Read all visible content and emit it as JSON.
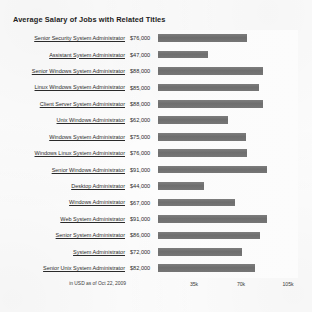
{
  "chart_data": {
    "type": "bar",
    "orientation": "horizontal",
    "title": "Average Salary of Jobs with Related Titles",
    "xlabel": "",
    "ylabel": "",
    "note": "in USD as of Oct 22, 2009",
    "xlim": [
      0,
      110000
    ],
    "grid": false,
    "legend": "none",
    "xticks": [
      {
        "label": "35k",
        "value": 35000
      },
      {
        "label": "70k",
        "value": 70000
      },
      {
        "label": "105k",
        "value": 105000
      }
    ],
    "categories": [
      "Senior Security System Administrator",
      "Assistant System Administrator",
      "Senior Windows System Administrator",
      "Linux Windows System Administrator",
      "Client Server System Administrator",
      "Unix Windows Administrator",
      "Windows System Administrator",
      "Windows Linux System Administrator",
      "Senior Windows Administrator",
      "Desktop Administrator",
      "Windows Administrator",
      "Web System Administrator",
      "Senior System Administrator",
      "System Administrator",
      "Senior Unix System Administrator"
    ],
    "values": [
      76000,
      47000,
      88000,
      85000,
      88000,
      62000,
      75000,
      76000,
      91000,
      44000,
      67000,
      91000,
      86000,
      72000,
      82000
    ],
    "value_labels": [
      "$76,000",
      "$47,000",
      "$88,000",
      "$85,000",
      "$88,000",
      "$62,000",
      "$75,000",
      "$76,000",
      "$91,000",
      "$44,000",
      "$67,000",
      "$91,000",
      "$86,000",
      "$72,000",
      "$82,000"
    ],
    "bar_color": "#727272"
  },
  "rows": [
    {
      "label": "Senior Security System Administrator",
      "value_label": "$76,000",
      "value": 76000
    },
    {
      "label": "Assistant System Administrator",
      "value_label": "$47,000",
      "value": 47000
    },
    {
      "label": "Senior Windows System Administrator",
      "value_label": "$88,000",
      "value": 88000
    },
    {
      "label": "Linux Windows System Administrator",
      "value_label": "$85,000",
      "value": 85000
    },
    {
      "label": "Client Server System Administrator",
      "value_label": "$88,000",
      "value": 88000
    },
    {
      "label": "Unix Windows Administrator",
      "value_label": "$62,000",
      "value": 62000
    },
    {
      "label": "Windows System Administrator",
      "value_label": "$75,000",
      "value": 75000
    },
    {
      "label": "Windows Linux System Administrator",
      "value_label": "$76,000",
      "value": 76000
    },
    {
      "label": "Senior Windows Administrator",
      "value_label": "$91,000",
      "value": 91000
    },
    {
      "label": "Desktop Administrator",
      "value_label": "$44,000",
      "value": 44000
    },
    {
      "label": "Windows Administrator",
      "value_label": "$67,000",
      "value": 67000
    },
    {
      "label": "Web System Administrator",
      "value_label": "$91,000",
      "value": 91000
    },
    {
      "label": "Senior System Administrator",
      "value_label": "$86,000",
      "value": 86000
    },
    {
      "label": "System Administrator",
      "value_label": "$72,000",
      "value": 72000
    },
    {
      "label": "Senior Unix System Administrator",
      "value_label": "$82,000",
      "value": 82000
    }
  ]
}
